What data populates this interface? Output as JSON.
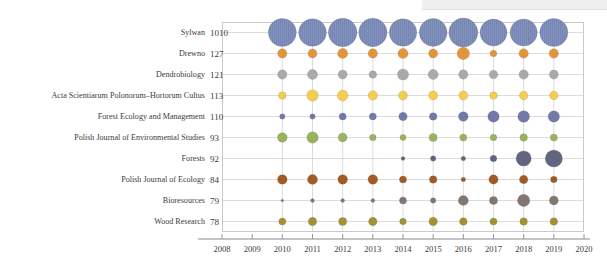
{
  "chart_data": {
    "type": "scatter",
    "title": "",
    "subtitle": "",
    "xlabel": "",
    "ylabel": "",
    "xlim": [
      2008,
      2020
    ],
    "x_ticks": [
      2008,
      2009,
      2010,
      2011,
      2012,
      2013,
      2014,
      2015,
      2016,
      2017,
      2018,
      2019,
      2020
    ],
    "x": [
      2010,
      2011,
      2012,
      2013,
      2014,
      2015,
      2016,
      2017,
      2018,
      2019
    ],
    "grid": true,
    "legend": "none",
    "bubble_encoding": "area proportional to publication count per journal per year",
    "categories": [
      "Sylwan",
      "Drewno",
      "Dendrobiology",
      "Acta Scientiarum Polonorum–Hortorum Cultus",
      "Forest Ecology and Management",
      "Polish Journal of Environmental Studies",
      "Forests",
      "Polish Journal of Ecology",
      "Bioresources",
      "Wood Research"
    ],
    "category_totals": [
      1010,
      127,
      121,
      113,
      110,
      93,
      92,
      84,
      79,
      78
    ],
    "series": [
      {
        "name": "Sylwan",
        "total": 1010,
        "color": "#8493bd",
        "values": [
          108,
          106,
          113,
          111,
          104,
          107,
          116,
          100,
          102,
          109
        ]
      },
      {
        "name": "Drewno",
        "total": 127,
        "color": "#e1902e",
        "values": [
          12,
          11,
          14,
          12,
          14,
          11,
          21,
          6,
          12,
          12
        ]
      },
      {
        "name": "Dendrobiology",
        "total": 121,
        "color": "#a6a5a1",
        "values": [
          12,
          14,
          11,
          8,
          17,
          14,
          12,
          10,
          12,
          11
        ]
      },
      {
        "name": "Acta Scientiarum Polonorum–Hortorum Cultus",
        "total": 113,
        "color": "#f5ca45",
        "values": [
          8,
          18,
          16,
          12,
          11,
          11,
          11,
          8,
          10,
          10
        ]
      },
      {
        "name": "Forest Ecology and Management",
        "total": 110,
        "color": "#6a73a8",
        "values": [
          4,
          4,
          7,
          7,
          10,
          8,
          13,
          18,
          19,
          18
        ]
      },
      {
        "name": "Polish Journal of Environmental Studies",
        "total": 93,
        "color": "#94b054",
        "values": [
          13,
          18,
          11,
          6,
          5,
          9,
          7,
          6,
          8,
          7
        ]
      },
      {
        "name": "Forests",
        "total": 92,
        "color": "#5b5d79",
        "values": [
          0,
          0,
          0,
          0,
          2,
          4,
          3,
          6,
          32,
          41
        ]
      },
      {
        "name": "Polish Journal of Ecology",
        "total": 84,
        "color": "#9d5218",
        "values": [
          13,
          14,
          13,
          13,
          7,
          8,
          3,
          12,
          10,
          6
        ]
      },
      {
        "name": "Bioresources",
        "total": 79,
        "color": "#7b7069",
        "values": [
          1,
          2,
          2,
          2,
          7,
          4,
          14,
          9,
          21,
          11
        ]
      },
      {
        "name": "Wood Research",
        "total": 78,
        "color": "#a08c26",
        "values": [
          7,
          10,
          9,
          10,
          6,
          10,
          8,
          7,
          8,
          8
        ]
      }
    ]
  }
}
